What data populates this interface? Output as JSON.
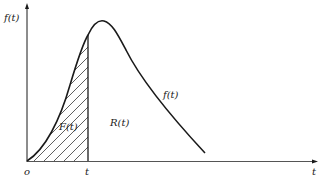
{
  "diagram": {
    "y_axis_label": "f(t)",
    "x_axis_label": "t",
    "origin_label": "o",
    "t_marker_label": "t",
    "curve_label": "f(t)",
    "shaded_region_label": "F(t)",
    "unshaded_region_label": "R(t)",
    "colors": {
      "ink": "#1a1a1a",
      "axis": "#555555"
    }
  }
}
